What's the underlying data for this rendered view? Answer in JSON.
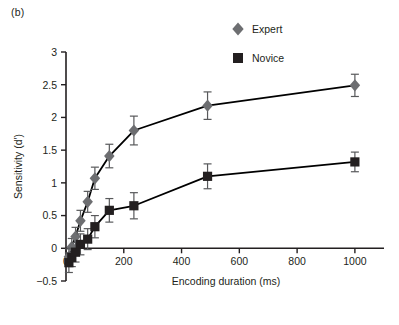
{
  "panel": {
    "label": "(b)"
  },
  "chart_data": {
    "type": "line",
    "title": "",
    "subtitle": "",
    "xlabel": "Encoding duration (ms)",
    "ylabel": "Sensitivity (d′)",
    "xlim": [
      0,
      1080
    ],
    "ylim": [
      -0.5,
      3
    ],
    "xticks": [
      0,
      200,
      400,
      600,
      800,
      1000
    ],
    "xticklabels": [
      "0",
      "200",
      "400",
      "600",
      "800",
      "1000"
    ],
    "yticks": [
      -0.5,
      0,
      0.5,
      1,
      1.5,
      2,
      2.5,
      3
    ],
    "yticklabels": [
      "−0.5",
      "0",
      "0.5",
      "1",
      "1.5",
      "2",
      "2.5",
      "3"
    ],
    "grid": false,
    "legend_position": "top-right",
    "series": [
      {
        "name": "Expert",
        "marker": "diamond",
        "color": "#6d6e71",
        "line_color": "#000000",
        "x": [
          10,
          20,
          33,
          50,
          75,
          100,
          150,
          235,
          490,
          1000
        ],
        "values": [
          -0.13,
          0.02,
          0.18,
          0.42,
          0.71,
          1.07,
          1.41,
          1.8,
          2.18,
          2.49
        ],
        "errors": [
          0.12,
          0.13,
          0.14,
          0.16,
          0.16,
          0.17,
          0.18,
          0.22,
          0.21,
          0.17
        ]
      },
      {
        "name": "Novice",
        "marker": "square",
        "color": "#231f20",
        "line_color": "#000000",
        "x": [
          10,
          20,
          33,
          50,
          75,
          100,
          150,
          235,
          490,
          1000
        ],
        "values": [
          -0.22,
          -0.14,
          -0.06,
          0.06,
          0.14,
          0.33,
          0.58,
          0.65,
          1.1,
          1.32
        ],
        "errors": [
          0.15,
          0.14,
          0.15,
          0.16,
          0.16,
          0.17,
          0.18,
          0.2,
          0.19,
          0.15
        ]
      }
    ],
    "legend": [
      {
        "label": "Expert",
        "marker": "diamond",
        "color": "#6d6e71"
      },
      {
        "label": "Novice",
        "marker": "square",
        "color": "#231f20"
      }
    ]
  }
}
